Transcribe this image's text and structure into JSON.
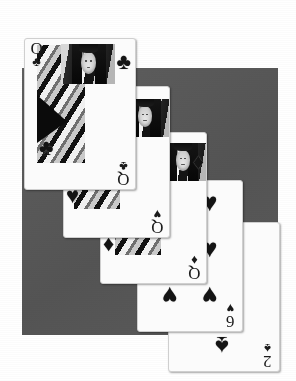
{
  "image": {
    "subject": "overlapping-playing-cards",
    "description": "Five playing cards fanned in a descending staircase over a gray backdrop",
    "rendering": "grayscale-photograph",
    "background_color": "#ffffff",
    "backdrop_color": "#595959",
    "card_face_color": "#fbfbfb",
    "ink_color": "#1a1a1a"
  },
  "cards": [
    {
      "id": "card-1",
      "name": "Queen of Clubs",
      "rank": "Q",
      "suit": "clubs",
      "suit_symbol": "♣",
      "type": "court",
      "z": 5
    },
    {
      "id": "card-2",
      "name": "Queen of Hearts",
      "rank": "Q",
      "suit": "hearts",
      "suit_symbol": "♥",
      "type": "court",
      "z": 4
    },
    {
      "id": "card-3",
      "name": "Queen of Diamonds",
      "rank": "Q",
      "suit": "diamonds",
      "suit_symbol": "♦",
      "type": "court",
      "z": 3
    },
    {
      "id": "card-4",
      "name": "Six of Hearts",
      "rank": "6",
      "suit": "hearts",
      "suit_symbol": "♥",
      "type": "number",
      "z": 2
    },
    {
      "id": "card-5",
      "name": "Two of Spades",
      "rank": "2",
      "suit": "spades",
      "suit_symbol": "♠",
      "type": "number",
      "z": 1
    }
  ]
}
